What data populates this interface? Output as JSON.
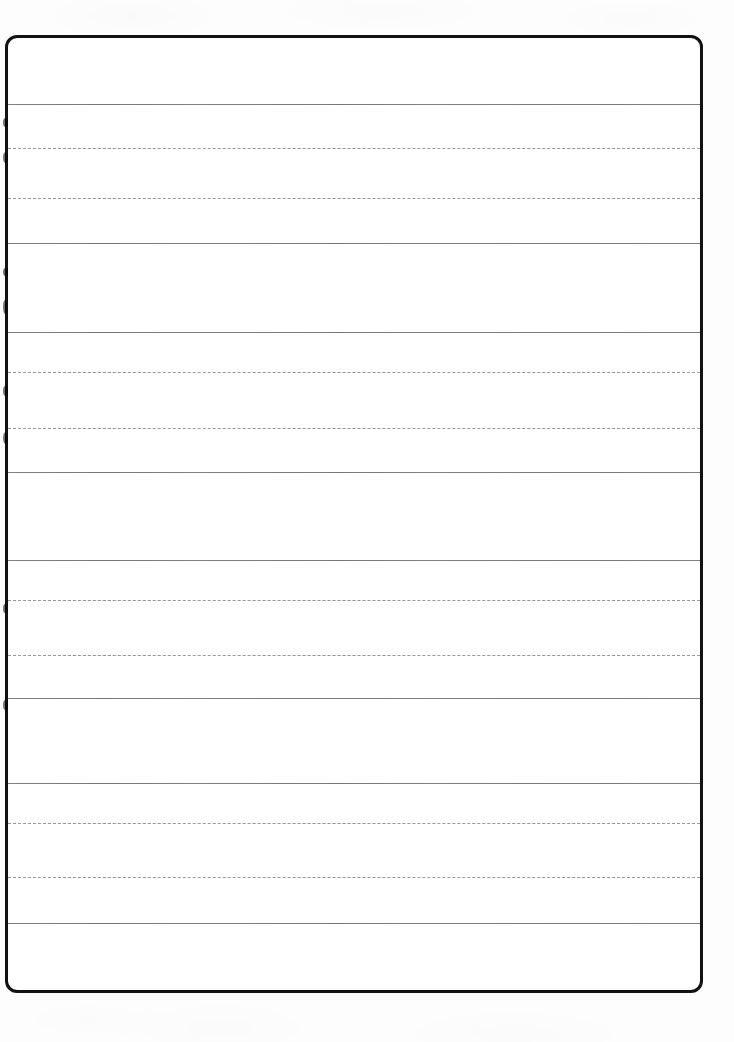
{
  "document": {
    "kind": "scanned-blank-lined-form",
    "title": "Blank Lined Form Page",
    "page_width": 734,
    "page_height": 1042,
    "background_color": "#fdfdfd",
    "paper_color": "#ffffff",
    "visible_text": [],
    "note": "No printed or handwritten text is present anywhere on this scanned sheet."
  },
  "frame": {
    "name": "page-border",
    "left": 5,
    "top": 35,
    "width": 698,
    "height": 958,
    "border_width": 3,
    "border_color": "#121212",
    "corner_radius": 12
  },
  "rules": {
    "solid_color": "#808080",
    "dotted_color": "#9a9a9a",
    "solid_width": 1,
    "dotted_width": 1,
    "dash_pattern": "2px dash / 2px gap",
    "items": [
      {
        "id": "rule-solid-1",
        "style": "solid",
        "y": 104,
        "color": "#808080",
        "thickness": 1
      },
      {
        "id": "rule-dotted-1",
        "style": "dotted",
        "y": 148,
        "color": "#9a9a9a",
        "thickness": 1
      },
      {
        "id": "rule-dotted-2",
        "style": "dotted",
        "y": 198,
        "color": "#9a9a9a",
        "thickness": 1
      },
      {
        "id": "rule-solid-2",
        "style": "solid",
        "y": 243,
        "color": "#808080",
        "thickness": 1
      },
      {
        "id": "rule-solid-3",
        "style": "solid",
        "y": 332,
        "color": "#808080",
        "thickness": 1
      },
      {
        "id": "rule-dotted-3",
        "style": "dotted",
        "y": 372,
        "color": "#9a9a9a",
        "thickness": 1
      },
      {
        "id": "rule-dotted-4",
        "style": "dotted",
        "y": 428,
        "color": "#9a9a9a",
        "thickness": 1
      },
      {
        "id": "rule-solid-4",
        "style": "solid",
        "y": 472,
        "color": "#808080",
        "thickness": 1
      },
      {
        "id": "rule-solid-5",
        "style": "solid",
        "y": 560,
        "color": "#808080",
        "thickness": 1
      },
      {
        "id": "rule-dotted-5",
        "style": "dotted",
        "y": 600,
        "color": "#9a9a9a",
        "thickness": 1
      },
      {
        "id": "rule-dotted-6",
        "style": "dotted",
        "y": 655,
        "color": "#9a9a9a",
        "thickness": 1
      },
      {
        "id": "rule-solid-6",
        "style": "solid",
        "y": 698,
        "color": "#808080",
        "thickness": 1
      },
      {
        "id": "rule-solid-7",
        "style": "solid",
        "y": 783,
        "color": "#808080",
        "thickness": 1
      },
      {
        "id": "rule-dotted-7",
        "style": "dotted",
        "y": 823,
        "color": "#9a9a9a",
        "thickness": 1
      },
      {
        "id": "rule-dotted-8",
        "style": "dotted",
        "y": 877,
        "color": "#9a9a9a",
        "thickness": 1
      },
      {
        "id": "rule-solid-8",
        "style": "solid",
        "y": 923,
        "color": "#808080",
        "thickness": 1
      }
    ]
  },
  "writing_rows": [
    {
      "id": "row-1",
      "top": 35,
      "bottom": 104,
      "type": "header-band",
      "guides": 0
    },
    {
      "id": "row-2",
      "top": 104,
      "bottom": 243,
      "type": "ruled-band",
      "guides": 2
    },
    {
      "id": "row-3",
      "top": 243,
      "bottom": 332,
      "type": "plain-band",
      "guides": 0
    },
    {
      "id": "row-4",
      "top": 332,
      "bottom": 472,
      "type": "ruled-band",
      "guides": 2
    },
    {
      "id": "row-5",
      "top": 472,
      "bottom": 560,
      "type": "plain-band",
      "guides": 0
    },
    {
      "id": "row-6",
      "top": 560,
      "bottom": 698,
      "type": "ruled-band",
      "guides": 2
    },
    {
      "id": "row-7",
      "top": 698,
      "bottom": 783,
      "type": "plain-band",
      "guides": 0
    },
    {
      "id": "row-8",
      "top": 783,
      "bottom": 923,
      "type": "ruled-band",
      "guides": 2
    },
    {
      "id": "row-9",
      "top": 923,
      "bottom": 993,
      "type": "footer-band",
      "guides": 0
    }
  ],
  "edge_blots": [
    {
      "x": 3,
      "y": 118,
      "w": 5,
      "h": 9
    },
    {
      "x": 3,
      "y": 152,
      "w": 5,
      "h": 11
    },
    {
      "x": 3,
      "y": 268,
      "w": 5,
      "h": 8
    },
    {
      "x": 3,
      "y": 300,
      "w": 4,
      "h": 14
    },
    {
      "x": 3,
      "y": 386,
      "w": 5,
      "h": 10
    },
    {
      "x": 3,
      "y": 432,
      "w": 5,
      "h": 12
    },
    {
      "x": 3,
      "y": 604,
      "w": 4,
      "h": 9
    },
    {
      "x": 3,
      "y": 700,
      "w": 5,
      "h": 10
    }
  ]
}
